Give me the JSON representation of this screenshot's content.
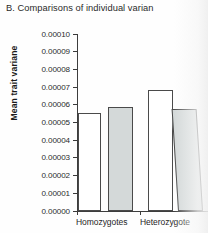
{
  "chart_data": {
    "type": "bar",
    "title": "B. Comparisons of individual varian",
    "xlabel": "",
    "ylabel": "Mean trait variane",
    "categories": [
      "Homozygotes",
      "Heterozygote"
    ],
    "series": [
      {
        "name": "white-bar",
        "values": [
          5.55e-05,
          6.85e-05
        ]
      },
      {
        "name": "gray-bar",
        "values": [
          5.85e-05,
          5.75e-05
        ]
      }
    ],
    "bars": [
      {
        "group": "Homozygotes",
        "fill": "white",
        "value": 5.55e-05
      },
      {
        "group": "Homozygotes",
        "fill": "gray",
        "value": 5.85e-05
      },
      {
        "group": "Heterozygote",
        "fill": "white",
        "value": 6.85e-05
      },
      {
        "group": "Heterozygote",
        "fill": "gray",
        "value": 5.75e-05
      }
    ],
    "ylim": [
      0.0,
      0.0001
    ],
    "ytick_step": 1e-05,
    "ytick_labels": [
      "0.00010",
      "0.00009",
      "0.00008",
      "0.00007",
      "0.00006",
      "0.00005",
      "0.00004",
      "0.00003",
      "0.00002",
      "0.00001",
      "0.00000"
    ],
    "grid": false,
    "legend": null,
    "colors": {
      "bar_white_fill": "#ffffff",
      "bar_gray_fill": "#d4d9d9",
      "bar_outline": "#4a4a4a",
      "axis": "#3d3d3d",
      "text": "#1c1c1c",
      "background": "#fefefe"
    }
  }
}
